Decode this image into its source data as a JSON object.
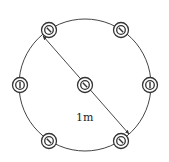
{
  "diagram": {
    "type": "pile-layout",
    "colors": {
      "stroke": "#333333",
      "background": "#ffffff"
    },
    "outer_circle": {
      "cx": 85,
      "cy": 85,
      "r": 66
    },
    "piles": [
      {
        "id": "top-left",
        "cx": 49,
        "cy": 30,
        "mark": "diagonal"
      },
      {
        "id": "top-right",
        "cx": 121,
        "cy": 30,
        "mark": "diagonal"
      },
      {
        "id": "left",
        "cx": 20,
        "cy": 85,
        "mark": "vertical"
      },
      {
        "id": "center",
        "cx": 85,
        "cy": 85,
        "mark": "diagonal"
      },
      {
        "id": "right",
        "cx": 150,
        "cy": 85,
        "mark": "vertical"
      },
      {
        "id": "bottom-left",
        "cx": 49,
        "cy": 141,
        "mark": "diagonal"
      },
      {
        "id": "bottom-right",
        "cx": 121,
        "cy": 141,
        "mark": "diagonal"
      }
    ],
    "dimension": {
      "label": "1m",
      "label_x": 76,
      "label_y": 121,
      "x1": 43,
      "y1": 36,
      "x2": 129,
      "y2": 134
    }
  }
}
